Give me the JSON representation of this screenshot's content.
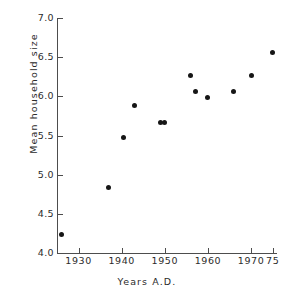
{
  "chart_data": {
    "type": "scatter",
    "title": "",
    "xlabel": "Years A.D.",
    "ylabel": "Mean household size",
    "xlim": [
      1925,
      1976
    ],
    "ylim": [
      4.0,
      7.0
    ],
    "grid": false,
    "legend": null,
    "xticks": [
      {
        "value": 1930,
        "label": "1930"
      },
      {
        "value": 1940,
        "label": "1940"
      },
      {
        "value": 1950,
        "label": "1950"
      },
      {
        "value": 1960,
        "label": "1960"
      },
      {
        "value": 1970,
        "label": "1970"
      },
      {
        "value": 1975,
        "label": "75"
      }
    ],
    "yticks": [
      {
        "value": 7.0,
        "label": "7.0"
      },
      {
        "value": 6.5,
        "label": "6.5"
      },
      {
        "value": 6.0,
        "label": "6.0"
      },
      {
        "value": 5.5,
        "label": "5.5"
      },
      {
        "value": 5.0,
        "label": "5.0"
      },
      {
        "value": 4.5,
        "label": "4.5"
      },
      {
        "value": 4.0,
        "label": "4.0"
      }
    ],
    "marker": "filled-circle",
    "marker_color": "#161616",
    "axis_color": "#4d4d4d",
    "background_color": "#ffffff",
    "x": [
      1926,
      1937,
      1940.5,
      1943,
      1949,
      1950,
      1956,
      1957,
      1960,
      1966,
      1970,
      1975
    ],
    "y": [
      4.23,
      4.84,
      5.48,
      5.88,
      5.67,
      5.67,
      6.27,
      6.06,
      5.98,
      6.06,
      6.27,
      6.56
    ],
    "points": [
      {
        "x": 1926,
        "y": 4.23
      },
      {
        "x": 1937,
        "y": 4.84
      },
      {
        "x": 1940.5,
        "y": 5.48
      },
      {
        "x": 1943,
        "y": 5.88
      },
      {
        "x": 1949,
        "y": 5.67
      },
      {
        "x": 1950,
        "y": 5.67
      },
      {
        "x": 1956,
        "y": 6.27
      },
      {
        "x": 1957,
        "y": 6.06
      },
      {
        "x": 1960,
        "y": 5.98
      },
      {
        "x": 1966,
        "y": 6.06
      },
      {
        "x": 1970,
        "y": 6.27
      },
      {
        "x": 1975,
        "y": 6.56
      }
    ]
  }
}
